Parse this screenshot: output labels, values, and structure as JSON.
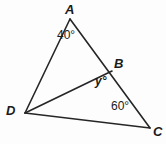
{
  "figure": {
    "type": "geometry-diagram",
    "shape": "quadrilateral-with-diagonal",
    "background_color": "#fdfdfd",
    "stroke_color": "#262626",
    "text_color": "#1a1a1a",
    "width": 166,
    "height": 144,
    "vertices": [
      {
        "id": "A",
        "label": "A",
        "x": 70,
        "y": 19,
        "label_x": 65,
        "label_y": 3
      },
      {
        "id": "B",
        "label": "B",
        "x": 112,
        "y": 71,
        "label_x": 114,
        "label_y": 57
      },
      {
        "id": "C",
        "label": "C",
        "x": 150,
        "y": 128,
        "label_x": 153,
        "label_y": 125
      },
      {
        "id": "D",
        "label": "D",
        "x": 25,
        "y": 113,
        "label_x": 6,
        "label_y": 104
      }
    ],
    "segments": [
      {
        "id": "AD",
        "from": "A",
        "to": "D",
        "x1": 70,
        "y1": 19,
        "x2": 25,
        "y2": 113
      },
      {
        "id": "AC",
        "from": "A",
        "to": "C",
        "x1": 70,
        "y1": 19,
        "x2": 150,
        "y2": 128
      },
      {
        "id": "DB",
        "from": "D",
        "to": "B",
        "x1": 25,
        "y1": 113,
        "x2": 112,
        "y2": 71
      },
      {
        "id": "DC",
        "from": "D",
        "to": "C",
        "x1": 25,
        "y1": 113,
        "x2": 150,
        "y2": 128
      }
    ],
    "angles": [
      {
        "id": "angle-A",
        "at": "A",
        "label": "40°",
        "value": 40,
        "label_x": 57,
        "label_y": 29,
        "known": true
      },
      {
        "id": "angle-B",
        "at": "B",
        "label": "y°",
        "value": null,
        "label_x": 95,
        "label_y": 75,
        "known": false
      },
      {
        "id": "angle-C",
        "at": "C",
        "label": "60°",
        "value": 60,
        "label_x": 111,
        "label_y": 100,
        "known": true
      }
    ]
  }
}
